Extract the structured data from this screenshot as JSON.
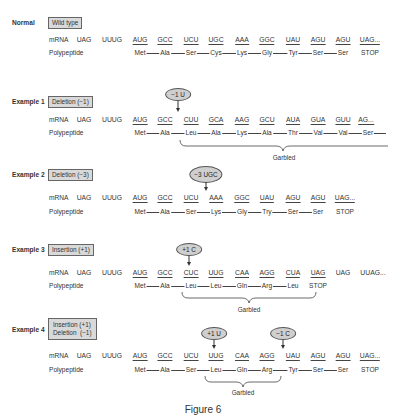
{
  "figure": {
    "caption": "Figure 6"
  },
  "labels": {
    "mrna": "mRNA",
    "polypeptide": "Polypeptide",
    "garbled": "Garbled"
  },
  "sections": [
    {
      "title": "Normal",
      "tag": [
        "Wild type"
      ],
      "mrna": [
        {
          "text": "UAG",
          "underline": false
        },
        {
          "text": "UUUG",
          "underline": false
        },
        {
          "text": "AUG",
          "underline": true
        },
        {
          "text": "GCC",
          "underline": true
        },
        {
          "text": "UCU",
          "underline": true
        },
        {
          "text": "UGC",
          "underline": true
        },
        {
          "text": "AAA",
          "underline": true
        },
        {
          "text": "GGC",
          "underline": true
        },
        {
          "text": "UAU",
          "underline": true
        },
        {
          "text": "AGU",
          "underline": true
        },
        {
          "text": "AGU",
          "underline": true
        },
        {
          "text": "UAG...",
          "underline": true
        }
      ],
      "polypeptide": [
        "Met",
        "Ala",
        "Ser",
        "Cys",
        "Lys",
        "Gly",
        "Tyr",
        "Ser",
        "Ser",
        "STOP"
      ],
      "mutations": [],
      "garbled": null
    },
    {
      "title": "Example 1",
      "tag": [
        "Deletion (−1)"
      ],
      "mrna": [
        {
          "text": "UAG",
          "underline": false
        },
        {
          "text": "UUUG",
          "underline": false
        },
        {
          "text": "AUG",
          "underline": true
        },
        {
          "text": "GCC",
          "underline": true
        },
        {
          "text": "CUU",
          "underline": true
        },
        {
          "text": "GCA",
          "underline": true
        },
        {
          "text": "AAG",
          "underline": true
        },
        {
          "text": "GCU",
          "underline": true
        },
        {
          "text": "AUA",
          "underline": true
        },
        {
          "text": "GUA",
          "underline": true
        },
        {
          "text": "GUU",
          "underline": true
        },
        {
          "text": "AG...",
          "underline": true
        }
      ],
      "polypeptide": [
        "Met",
        "Ala",
        "Leu",
        "Ala",
        "Lys",
        "Ala",
        "Thr",
        "Val",
        "Val",
        "Ser"
      ],
      "mutations": [
        {
          "label": "−1 U",
          "between": "GCC|CUU"
        }
      ],
      "garbled": {
        "from": "Leu",
        "to": "end"
      }
    },
    {
      "title": "Example 2",
      "tag": [
        "Deletion (−3)"
      ],
      "mrna": [
        {
          "text": "UAG",
          "underline": false
        },
        {
          "text": "UUUG",
          "underline": false
        },
        {
          "text": "AUG",
          "underline": true
        },
        {
          "text": "GCC",
          "underline": true
        },
        {
          "text": "UCU",
          "underline": true
        },
        {
          "text": "AAA",
          "underline": true
        },
        {
          "text": "GGC",
          "underline": true
        },
        {
          "text": "UAU",
          "underline": true
        },
        {
          "text": "AGU",
          "underline": true
        },
        {
          "text": "AGU",
          "underline": true
        },
        {
          "text": "UAG...",
          "underline": true
        }
      ],
      "polypeptide": [
        "Met",
        "Ala",
        "Ser",
        "Lys",
        "Gly",
        "Try",
        "Ser",
        "Ser",
        "STOP"
      ],
      "mutations": [
        {
          "label": "−3 UGC",
          "between": "UCU|AAA"
        }
      ],
      "garbled": null
    },
    {
      "title": "Example 3",
      "tag": [
        "Insertion (+1)"
      ],
      "mrna": [
        {
          "text": "UAG",
          "underline": false
        },
        {
          "text": "UUUG",
          "underline": false
        },
        {
          "text": "AUG",
          "underline": true
        },
        {
          "text": "GCC",
          "underline": true
        },
        {
          "text": "CUC",
          "underline": true
        },
        {
          "text": "UUG",
          "underline": true
        },
        {
          "text": "CAA",
          "underline": true
        },
        {
          "text": "AGG",
          "underline": true
        },
        {
          "text": "CUA",
          "underline": true
        },
        {
          "text": "UAG",
          "underline": true
        },
        {
          "text": "UAG",
          "underline": false
        },
        {
          "text": "UUAG...",
          "underline": false
        }
      ],
      "polypeptide": [
        "Met",
        "Ala",
        "Leu",
        "Leu",
        "Gln",
        "Arg",
        "Leu",
        "STOP"
      ],
      "mutations": [
        {
          "label": "+1 C",
          "between": "GCC|CUC"
        }
      ],
      "garbled": {
        "from": "Leu",
        "to": "STOP"
      }
    },
    {
      "title": "Example 4",
      "tag": [
        "Insertion (+1)",
        "Deletion  (−1)"
      ],
      "mrna": [
        {
          "text": "UAG",
          "underline": false
        },
        {
          "text": "UUUG",
          "underline": false
        },
        {
          "text": "AUG",
          "underline": true
        },
        {
          "text": "GCC",
          "underline": true
        },
        {
          "text": "UCU",
          "underline": true
        },
        {
          "text": "UUG",
          "underline": true
        },
        {
          "text": "CAA",
          "underline": true
        },
        {
          "text": "AGG",
          "underline": true
        },
        {
          "text": "UAU",
          "underline": true
        },
        {
          "text": "AGU",
          "underline": true
        },
        {
          "text": "AGU",
          "underline": true
        },
        {
          "text": "UAG...",
          "underline": true
        }
      ],
      "polypeptide": [
        "Met",
        "Ala",
        "Ser",
        "Leu",
        "Gln",
        "Arg",
        "Tyr",
        "Ser",
        "Ser",
        "STOP"
      ],
      "mutations": [
        {
          "label": "+1 U",
          "between": "UCU|UUG"
        },
        {
          "label": "−1 C",
          "between": "AGG|UAU"
        }
      ],
      "garbled": {
        "from": "Leu",
        "to": "Arg"
      }
    }
  ]
}
